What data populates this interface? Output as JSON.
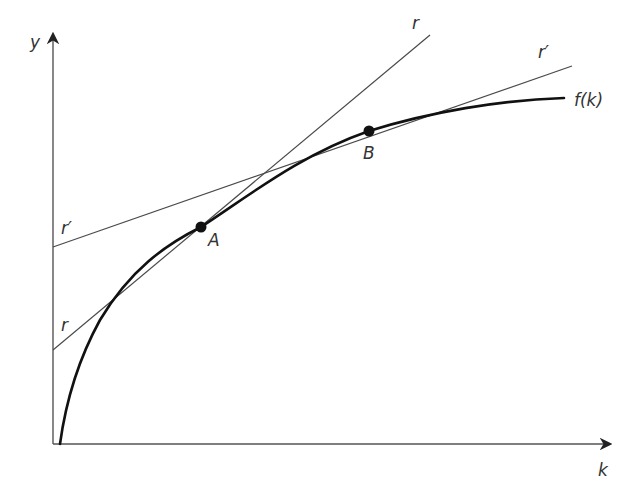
{
  "diagram": {
    "type": "economic-production-function",
    "axes": {
      "x_label": "k",
      "y_label": "y"
    },
    "curve": {
      "label": "f(k)",
      "description": "concave production function starting at origin"
    },
    "lines": [
      {
        "id": "r",
        "label_end": "r",
        "label_intercept": "r",
        "tangent_point": "A",
        "slope": "steeper"
      },
      {
        "id": "r_prime",
        "label_end": "r′",
        "label_intercept": "r′",
        "tangent_point": "B",
        "slope": "flatter"
      }
    ],
    "points": [
      {
        "label": "A",
        "on": "f(k)",
        "tangent_line": "r"
      },
      {
        "label": "B",
        "on": "f(k)",
        "tangent_line": "r′"
      }
    ],
    "colors": {
      "background": "#ffffff",
      "curve": "#111111",
      "lines": "#4a4a4a",
      "axis": "#555555",
      "text": "#333333"
    }
  }
}
